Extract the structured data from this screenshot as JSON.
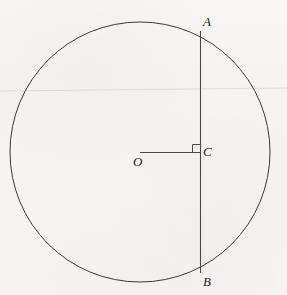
{
  "figure": {
    "kind": "geometry-diagram",
    "background_color": "#f6f5f3",
    "stroke_color": "#3a3a3a",
    "label_color": "#1b1b1b",
    "canvas": {
      "width": 287,
      "height": 295
    },
    "circle": {
      "name": "circle-O",
      "center_x": 140,
      "center_y": 152,
      "radius": 130,
      "stroke_width": 1
    },
    "chord": {
      "name": "chord-AB",
      "x1": 200,
      "y1": 32,
      "x2": 200,
      "y2": 272,
      "stroke_width": 1.1
    },
    "radius_segment": {
      "name": "segment-OC",
      "x1": 140,
      "y1": 152,
      "x2": 200,
      "y2": 152,
      "stroke_width": 1
    },
    "right_angle_marker": {
      "name": "right-angle-at-C",
      "size": 8,
      "corner_x": 200,
      "corner_y": 152,
      "orientation": "upper-left"
    },
    "artifact_line": {
      "name": "scan-artifact-line",
      "y": 90,
      "opacity": 0.1
    },
    "labels": {
      "A": "A",
      "B": "B",
      "C": "C",
      "O": "O"
    }
  }
}
